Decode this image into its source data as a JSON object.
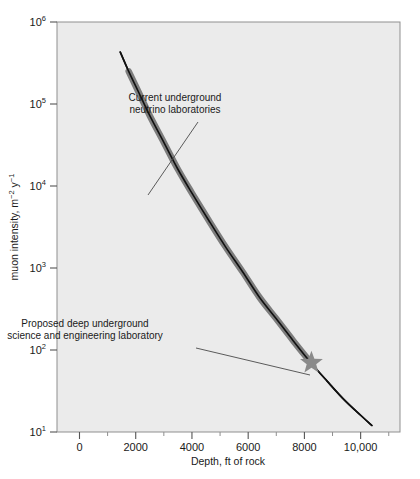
{
  "chart_data": {
    "type": "line",
    "title": "",
    "xlabel": "Depth, ft of rock",
    "ylabel": "muon intensity, m⁻² y⁻¹",
    "yscale": "log",
    "xscale": "linear",
    "xlim": [
      -800,
      11400
    ],
    "ylim": [
      10,
      1000000
    ],
    "grid": false,
    "legend": null,
    "plot_background": "#ebebeb",
    "page_background": "#ffffff",
    "curve_color_thin": "#111111",
    "curve_color_thick": "#7d7d7d",
    "marker_color": "#8a8a8a",
    "xticks": [
      {
        "value": 0,
        "label": "0"
      },
      {
        "value": 2000,
        "label": "2000"
      },
      {
        "value": 4000,
        "label": "4000"
      },
      {
        "value": 6000,
        "label": "6000"
      },
      {
        "value": 8000,
        "label": "8000"
      },
      {
        "value": 10000,
        "label": "10,000"
      }
    ],
    "xminorticks": [
      1000,
      3000,
      5000,
      7000,
      9000,
      11000
    ],
    "yticks": [
      {
        "value": 1000000,
        "mantissa": "10",
        "exponent": "6"
      },
      {
        "value": 100000,
        "mantissa": "10",
        "exponent": "5"
      },
      {
        "value": 10000,
        "mantissa": "10",
        "exponent": "4"
      },
      {
        "value": 1000,
        "mantissa": "10",
        "exponent": "3"
      },
      {
        "value": 100,
        "mantissa": "10",
        "exponent": "2"
      },
      {
        "value": 10,
        "mantissa": "10",
        "exponent": "1"
      }
    ],
    "series": [
      {
        "name": "muon intensity vs depth",
        "points": [
          {
            "x": 1450,
            "y": 430000
          },
          {
            "x": 1750,
            "y": 250000
          },
          {
            "x": 2100,
            "y": 140000
          },
          {
            "x": 2500,
            "y": 72000
          },
          {
            "x": 3000,
            "y": 34000
          },
          {
            "x": 3500,
            "y": 16000
          },
          {
            "x": 4000,
            "y": 8200
          },
          {
            "x": 4600,
            "y": 3800
          },
          {
            "x": 5200,
            "y": 1800
          },
          {
            "x": 5800,
            "y": 900
          },
          {
            "x": 6400,
            "y": 440
          },
          {
            "x": 7000,
            "y": 240
          },
          {
            "x": 7600,
            "y": 130
          },
          {
            "x": 8200,
            "y": 72
          },
          {
            "x": 8800,
            "y": 42
          },
          {
            "x": 9400,
            "y": 25
          },
          {
            "x": 10000,
            "y": 16
          },
          {
            "x": 10400,
            "y": 12
          }
        ],
        "thick_segment": {
          "from_x": 1750,
          "to_x": 8200,
          "description": "highlighted gray band of curve"
        }
      }
    ],
    "markers": [
      {
        "name": "proposed-lab-star",
        "shape": "star",
        "x": 8250,
        "y": 70
      }
    ],
    "annotations": [
      {
        "name": "current-underground-neutrino-laboratories",
        "lines": [
          "Current underground",
          "neutrino laboratories"
        ],
        "text_x": 175,
        "text_y": 101,
        "leader_from_x": 198,
        "leader_from_y": 122,
        "leader_to_x": 148,
        "leader_to_y": 195
      },
      {
        "name": "proposed-deep-underground-lab",
        "lines": [
          "Proposed deep underground",
          "science and engineering laboratory"
        ],
        "text_x": 85,
        "text_y": 327,
        "leader_from_x": 196,
        "leader_from_y": 348,
        "leader_to_x": 310,
        "leader_to_y": 375
      }
    ]
  },
  "figure": {
    "name": "muon-intensity-vs-depth-chart"
  }
}
